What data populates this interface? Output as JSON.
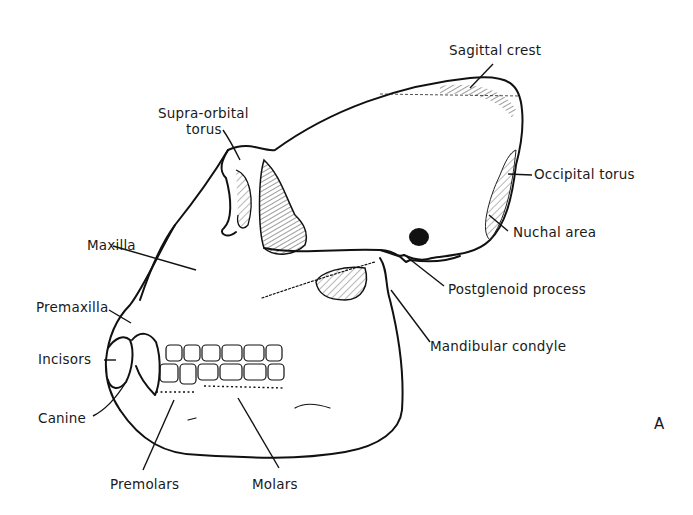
{
  "figure": {
    "panel_letter": "A",
    "labels": {
      "sagittal_crest": "Sagittal crest",
      "supra_orbital_torus_line1": "Supra-orbital",
      "supra_orbital_torus_line2": "torus",
      "occipital_torus": "Occipital torus",
      "nuchal_area": "Nuchal area",
      "maxilla": "Maxilla",
      "postglenoid_process": "Postglenoid process",
      "premaxilla": "Premaxilla",
      "mandibular_condyle": "Mandibular condyle",
      "incisors": "Incisors",
      "canine": "Canine",
      "premolars": "Premolars",
      "molars": "Molars"
    },
    "colors": {
      "ink": "#111111",
      "background": "#ffffff"
    }
  }
}
